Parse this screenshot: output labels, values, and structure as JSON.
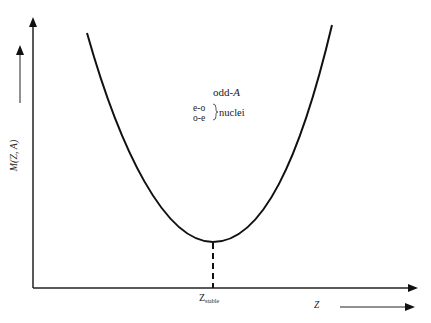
{
  "diagram": {
    "y_axis_label": "M(Z, A)",
    "x_axis_label": "Z",
    "minimum_label_main": "Z",
    "minimum_label_sub": "stable",
    "annotation": {
      "line1_prefix": "odd-",
      "line1_italic": "A",
      "types": [
        "e-o",
        "o-e"
      ],
      "bracket_label": "nuclei"
    },
    "colors": {
      "line": "#111111",
      "background": "#ffffff"
    }
  }
}
